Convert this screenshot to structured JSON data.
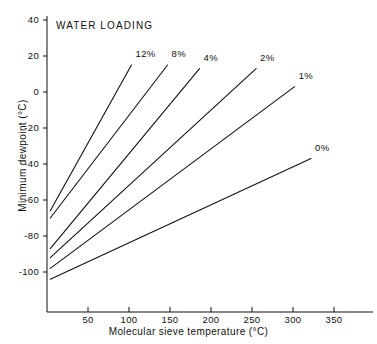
{
  "chart_data": {
    "type": "line",
    "title": "WATER LOADING",
    "xlabel": "Molecular sieve temperature (°C)",
    "ylabel": "Minimum dewpoint (°C)",
    "xlim": [
      0,
      360
    ],
    "ylim": [
      -112,
      45
    ],
    "grid": false,
    "legend_position": "inline-end-of-line",
    "xticks": [
      50,
      100,
      150,
      200,
      250,
      300,
      350
    ],
    "xtick_labels": [
      "50",
      "100",
      "150",
      "200",
      "250",
      "300",
      "350"
    ],
    "yticks": [
      40,
      20,
      0,
      -20,
      -40,
      -60,
      -80,
      -100
    ],
    "ytick_labels": [
      "40",
      "20",
      "0",
      "-20",
      "-40",
      "-60",
      "-80",
      "-100"
    ],
    "series": [
      {
        "name": "12%",
        "label": "12%",
        "x": [
          4,
          103
        ],
        "y": [
          -66,
          15
        ]
      },
      {
        "name": "8%",
        "label": "8%",
        "x": [
          4,
          147
        ],
        "y": [
          -70,
          15
        ]
      },
      {
        "name": "4%",
        "label": "4%",
        "x": [
          4,
          186
        ],
        "y": [
          -87,
          13
        ]
      },
      {
        "name": "2%",
        "label": "2%",
        "x": [
          4,
          255
        ],
        "y": [
          -92,
          13
        ]
      },
      {
        "name": "1%",
        "label": "1%",
        "x": [
          4,
          302
        ],
        "y": [
          -98,
          3
        ]
      },
      {
        "name": "0%",
        "label": "0%",
        "x": [
          4,
          322
        ],
        "y": [
          -104,
          -37
        ]
      }
    ],
    "colors": {
      "line": "#111111",
      "axis": "#111111",
      "background": "#ffffff"
    }
  }
}
